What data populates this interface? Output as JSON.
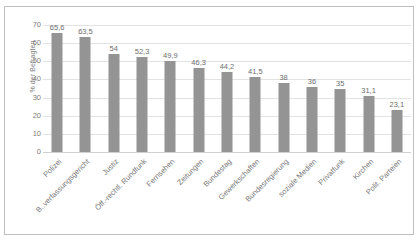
{
  "chart_data": {
    "type": "bar",
    "title": "",
    "subtitle": "",
    "xlabel": "",
    "ylabel": "% der Befragten",
    "ylim": [
      0,
      70
    ],
    "ytick_step": 10,
    "yticks": [
      "0",
      "10",
      "20",
      "30",
      "40",
      "50",
      "60",
      "70"
    ],
    "grid": true,
    "legend": false,
    "legend_position": "none",
    "decimal_separator": ",",
    "orientation": "vertical",
    "categories": [
      "Polizei",
      "B..verfassungsgericht",
      "Justiz",
      "Öff.-rechtl. Rundfunk",
      "Fernsehen",
      "Zeitungen",
      "Bundestag",
      "Gewerkschaften",
      "Bundesregierung",
      "soziale Medien",
      "Privatfunk",
      "Kirchen",
      "Polit. Parteien"
    ],
    "values": [
      65.6,
      63.5,
      54,
      52.3,
      49.9,
      46.3,
      44.2,
      41.5,
      38,
      36,
      35,
      31.1,
      23.1
    ],
    "value_labels": [
      "65,6",
      "63,5",
      "54",
      "52,3",
      "49,9",
      "46,3",
      "44,2",
      "41,5",
      "38",
      "36",
      "35",
      "31,1",
      "23,1"
    ],
    "series": [
      {
        "name": "",
        "values": [
          65.6,
          63.5,
          54,
          52.3,
          49.9,
          46.3,
          44.2,
          41.5,
          38,
          36,
          35,
          31.1,
          23.1
        ]
      }
    ]
  },
  "style": {
    "bar_color": "#949494",
    "gridline_color": "#e3e3e3",
    "axis_color": "#d0d0d0",
    "text_color": "#787878",
    "border_color": "#bfbfbf",
    "background": "#ffffff"
  }
}
